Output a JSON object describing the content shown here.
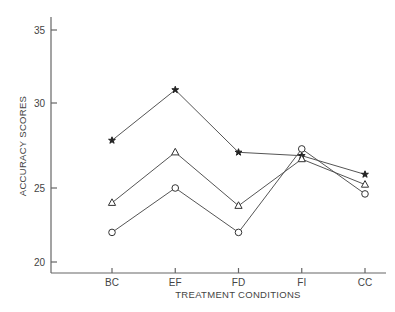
{
  "chart_data": {
    "type": "line",
    "title": "",
    "xlabel": "TREATMENT CONDITIONS",
    "ylabel": "ACCURACY SCORES",
    "categories": [
      "BC",
      "EF",
      "FD",
      "FI",
      "CC"
    ],
    "yticks": [
      20,
      25,
      30,
      35
    ],
    "ylim": [
      19.3,
      36
    ],
    "grid": false,
    "legend": "none",
    "series": [
      {
        "name": "star",
        "marker": "star",
        "values": [
          27.8,
          30.9,
          27.1,
          26.9,
          25.8
        ]
      },
      {
        "name": "triangle",
        "marker": "triangle",
        "values": [
          24.0,
          27.1,
          23.8,
          26.7,
          25.2
        ]
      },
      {
        "name": "circle",
        "marker": "circle",
        "values": [
          22.0,
          25.0,
          22.0,
          27.3,
          24.6
        ]
      }
    ]
  },
  "colors": {
    "axis": "#666666",
    "line": "#555555",
    "text": "#444444",
    "background": "#ffffff"
  }
}
